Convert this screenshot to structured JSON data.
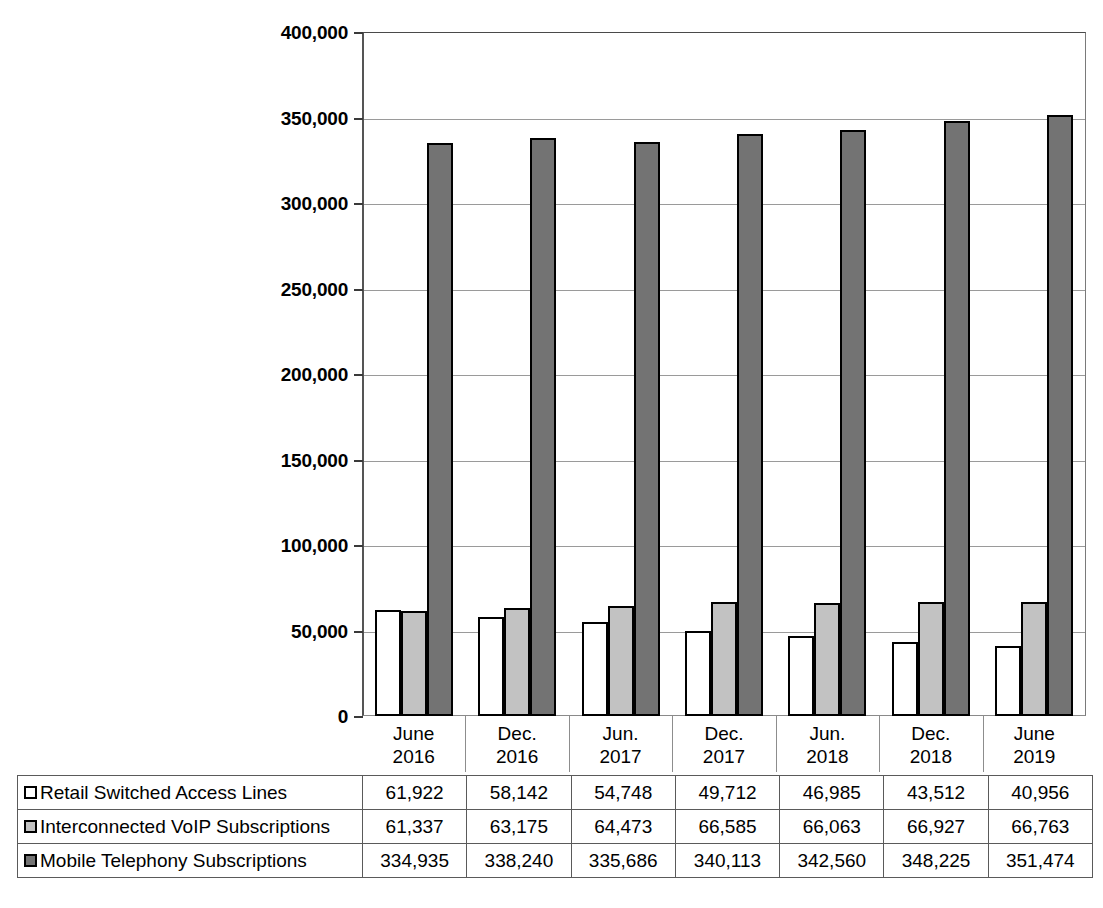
{
  "chart_data": {
    "type": "bar",
    "title": "",
    "subtitle": "",
    "xlabel": "",
    "ylabel": "",
    "grid": true,
    "legend_position": "table-below",
    "ylim": [
      0,
      400000
    ],
    "ytick_interval": 50000,
    "ytick_labels": [
      "400,000",
      "350,000",
      "300,000",
      "250,000",
      "200,000",
      "150,000",
      "100,000",
      "50,000",
      "0"
    ],
    "ytick_values": [
      400000,
      350000,
      300000,
      250000,
      200000,
      150000,
      100000,
      50000,
      0
    ],
    "categories": [
      "June\n2016",
      "Dec.\n2016",
      "Jun.\n2017",
      "Dec.\n2017",
      "Jun.\n2018",
      "Dec.\n2018",
      "June\n2019"
    ],
    "category_lines": [
      [
        "June",
        "2016"
      ],
      [
        "Dec.",
        "2016"
      ],
      [
        "Jun.",
        "2017"
      ],
      [
        "Dec.",
        "2017"
      ],
      [
        "Jun.",
        "2018"
      ],
      [
        "Dec.",
        "2018"
      ],
      [
        "June",
        "2019"
      ]
    ],
    "series": [
      {
        "name": "Retail Switched Access Lines",
        "color": "#ffffff",
        "values": [
          61922,
          58142,
          54748,
          49712,
          46985,
          43512,
          40956
        ],
        "labels": [
          "61,922",
          "58,142",
          "54,748",
          "49,712",
          "46,985",
          "43,512",
          "40,956"
        ]
      },
      {
        "name": "Interconnected VoIP Subscriptions",
        "color": "#c2c2c2",
        "values": [
          61337,
          63175,
          64473,
          66585,
          66063,
          66927,
          66763
        ],
        "labels": [
          "61,337",
          "63,175",
          "64,473",
          "66,585",
          "66,063",
          "66,927",
          "66,763"
        ]
      },
      {
        "name": "Mobile Telephony Subscriptions",
        "color": "#737373",
        "values": [
          334935,
          338240,
          335686,
          340113,
          342560,
          348225,
          351474
        ],
        "labels": [
          "334,935",
          "338,240",
          "335,686",
          "340,113",
          "342,560",
          "348,225",
          "351,474"
        ]
      }
    ]
  },
  "colors": {
    "series_1": "#ffffff",
    "series_2": "#c2c2c2",
    "series_3": "#737373",
    "bar_outline": "#000000",
    "gridline": "#9a9a9a",
    "axis": "#555555",
    "table_border": "#5a5a5a"
  }
}
